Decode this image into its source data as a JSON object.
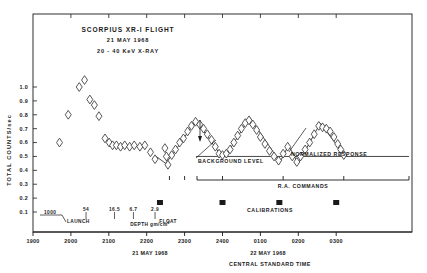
{
  "chart_data": {
    "type": "scatter",
    "title": "SCORPIUS XR-I FLIGHT",
    "subtitle": "21 MAY 1968",
    "subtitle2": "20 - 40 KeV X-RAY",
    "xlabel": "CENTRAL STANDARD TIME",
    "ylabel": "TOTAL COUNTS/sec",
    "xlim": [
      1900,
      2900
    ],
    "ylim": [
      0.0,
      1.08
    ],
    "grid": false,
    "legend": "none",
    "marker": "open-diamond",
    "x_ticklabels": [
      "1900",
      "2000",
      "2100",
      "2200",
      "2300",
      "2400",
      "0100",
      "0200",
      "0300"
    ],
    "x_tickvalues": [
      1900,
      2000,
      2100,
      2200,
      2300,
      2400,
      2500,
      2600,
      2700
    ],
    "y_ticklabels": [
      "0.1",
      "0.2",
      "0.3",
      "0.4",
      "0.5",
      "0.6",
      "0.7",
      "0.8",
      "0.9",
      "1.0"
    ],
    "y_tickvalues": [
      0.1,
      0.2,
      0.3,
      0.4,
      0.5,
      0.6,
      0.7,
      0.8,
      0.9,
      1.0
    ],
    "date_left": "21 MAY 1968",
    "date_right": "22 MAY 1968",
    "depth_axis_label": "DEPTH gm/cm",
    "depth_axis_exponent": "2",
    "depth_labels": [
      "54",
      "16.5",
      "6.7",
      "2.9"
    ],
    "depth_values": [
      2040,
      2115,
      2165,
      2222
    ],
    "launch_time_label": "1000",
    "launch_label": "LAUNCH",
    "float_label": "FLOAT",
    "background_level_label": "BACKGROUND LEVEL",
    "normalized_response_label": "NORMALIZED RESPONSE",
    "ra_commands_label": "R.A. COMMANDS",
    "calibrations_label": "CALIBRATIONS",
    "background_level_value": 0.5,
    "points": [
      {
        "x": 1970,
        "y": 0.6
      },
      {
        "x": 1993,
        "y": 0.8
      },
      {
        "x": 2022,
        "y": 1.0
      },
      {
        "x": 2036,
        "y": 1.05
      },
      {
        "x": 2050,
        "y": 0.91
      },
      {
        "x": 2062,
        "y": 0.87
      },
      {
        "x": 2074,
        "y": 0.79
      },
      {
        "x": 2090,
        "y": 0.63
      },
      {
        "x": 2101,
        "y": 0.6
      },
      {
        "x": 2110,
        "y": 0.58
      },
      {
        "x": 2120,
        "y": 0.58
      },
      {
        "x": 2131,
        "y": 0.57
      },
      {
        "x": 2142,
        "y": 0.58
      },
      {
        "x": 2155,
        "y": 0.57
      },
      {
        "x": 2167,
        "y": 0.58
      },
      {
        "x": 2182,
        "y": 0.57
      },
      {
        "x": 2195,
        "y": 0.58
      },
      {
        "x": 2210,
        "y": 0.53
      },
      {
        "x": 2222,
        "y": 0.48
      },
      {
        "x": 2248,
        "y": 0.56
      },
      {
        "x": 2252,
        "y": 0.5
      },
      {
        "x": 2256,
        "y": 0.44
      },
      {
        "x": 2266,
        "y": 0.51
      },
      {
        "x": 2276,
        "y": 0.55
      },
      {
        "x": 2287,
        "y": 0.6
      },
      {
        "x": 2297,
        "y": 0.63
      },
      {
        "x": 2308,
        "y": 0.68
      },
      {
        "x": 2318,
        "y": 0.72
      },
      {
        "x": 2329,
        "y": 0.75
      },
      {
        "x": 2340,
        "y": 0.73
      },
      {
        "x": 2350,
        "y": 0.7
      },
      {
        "x": 2360,
        "y": 0.66
      },
      {
        "x": 2371,
        "y": 0.62
      },
      {
        "x": 2381,
        "y": 0.57
      },
      {
        "x": 2391,
        "y": 0.52
      },
      {
        "x": 2400,
        "y": 0.51
      },
      {
        "x": 2410,
        "y": 0.52
      },
      {
        "x": 2420,
        "y": 0.55
      },
      {
        "x": 2430,
        "y": 0.6
      },
      {
        "x": 2440,
        "y": 0.65
      },
      {
        "x": 2450,
        "y": 0.7
      },
      {
        "x": 2460,
        "y": 0.74
      },
      {
        "x": 2470,
        "y": 0.76
      },
      {
        "x": 2480,
        "y": 0.73
      },
      {
        "x": 2490,
        "y": 0.69
      },
      {
        "x": 2500,
        "y": 0.64
      },
      {
        "x": 2512,
        "y": 0.59
      },
      {
        "x": 2524,
        "y": 0.54
      },
      {
        "x": 2536,
        "y": 0.5
      },
      {
        "x": 2548,
        "y": 0.47
      },
      {
        "x": 2560,
        "y": 0.52
      },
      {
        "x": 2572,
        "y": 0.57
      },
      {
        "x": 2584,
        "y": 0.5
      },
      {
        "x": 2596,
        "y": 0.46
      },
      {
        "x": 2606,
        "y": 0.5
      },
      {
        "x": 2618,
        "y": 0.55
      },
      {
        "x": 2630,
        "y": 0.6
      },
      {
        "x": 2642,
        "y": 0.66
      },
      {
        "x": 2654,
        "y": 0.72
      },
      {
        "x": 2664,
        "y": 0.71
      },
      {
        "x": 2674,
        "y": 0.7
      },
      {
        "x": 2684,
        "y": 0.68
      },
      {
        "x": 2694,
        "y": 0.64
      },
      {
        "x": 2704,
        "y": 0.59
      },
      {
        "x": 2712,
        "y": 0.55
      },
      {
        "x": 2720,
        "y": 0.51
      }
    ],
    "response_curve": [
      {
        "x": 2225,
        "y": 0.5
      },
      {
        "x": 2250,
        "y": 0.45
      },
      {
        "x": 2270,
        "y": 0.52
      },
      {
        "x": 2330,
        "y": 0.76
      },
      {
        "x": 2398,
        "y": 0.5
      },
      {
        "x": 2412,
        "y": 0.52
      },
      {
        "x": 2472,
        "y": 0.78
      },
      {
        "x": 2552,
        "y": 0.46
      },
      {
        "x": 2574,
        "y": 0.58
      },
      {
        "x": 2600,
        "y": 0.45
      },
      {
        "x": 2658,
        "y": 0.74
      },
      {
        "x": 2724,
        "y": 0.5
      }
    ],
    "ra_command_marks": [
      2260,
      2300,
      2400,
      2560,
      2720
    ],
    "calibration_marks": [
      2235,
      2400,
      2550,
      2700
    ]
  }
}
